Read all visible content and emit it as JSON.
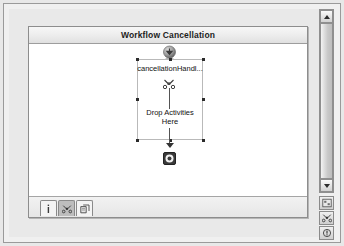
{
  "window": {
    "title": "Workflow Cancellation"
  },
  "designer": {
    "panel_title": "Workflow Cancellation",
    "start_icon": "cancellation-start-icon",
    "handler_label": "cancellationHandl...",
    "handler_glyph": "cancellation-handler-icon",
    "drop_line_1": "Drop Activities",
    "drop_line_2": "Here",
    "end_icon": "workflow-end-icon",
    "selection_handles": 8
  },
  "tabs": [
    {
      "name": "tab-properties",
      "icon": "info-icon",
      "label": "i",
      "active": false
    },
    {
      "name": "tab-cancel-handler",
      "icon": "cancel-handler-icon",
      "label": "",
      "active": true
    },
    {
      "name": "tab-fault-handler",
      "icon": "fault-handler-icon",
      "label": "",
      "active": false
    }
  ],
  "scrollbar": {
    "up_arrow": "scroll-up-arrow-icon",
    "down_arrow": "scroll-down-arrow-icon",
    "orientation": "vertical"
  },
  "corner_tools": [
    {
      "name": "corner-tool-1",
      "icon": "designer-view-icon"
    },
    {
      "name": "corner-tool-2",
      "icon": "cancel-handler-view-icon"
    },
    {
      "name": "corner-tool-3",
      "icon": "fault-handler-view-icon"
    }
  ],
  "colors": {
    "panel_bg": "#ffffff",
    "frame_bg": "#f0f0f0",
    "canvas_bg": "#e9e9e9",
    "header_text": "#1d1d1d",
    "connector": "#545454",
    "handle": "#2b2b2b",
    "tab_active": "#bdbdbd"
  }
}
